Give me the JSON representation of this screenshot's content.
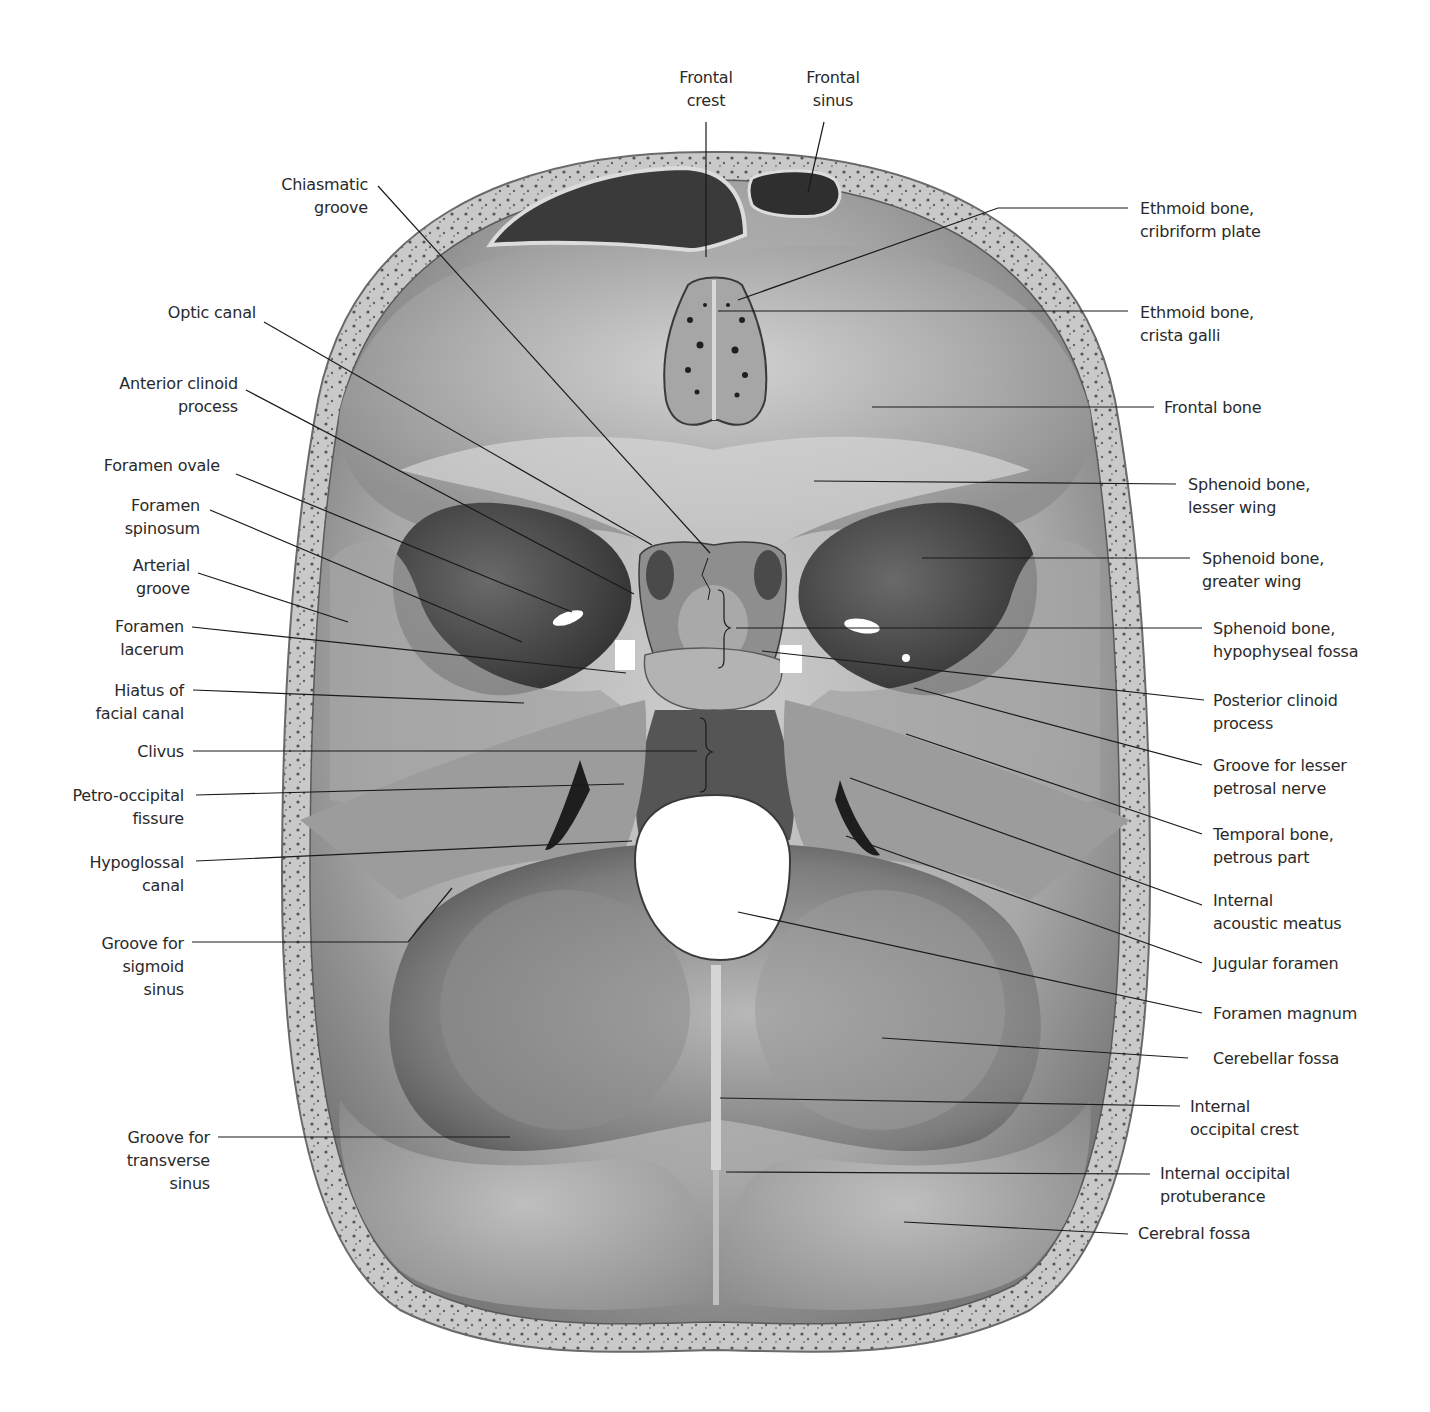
{
  "figure": {
    "colors": {
      "bone_light": "#d9d9d9",
      "bone_mid": "#9a9a9a",
      "bone_dark": "#4a4a4a",
      "cavity": "#2e2e2e",
      "foramen": "#ffffff",
      "leader": "#1a1a1a",
      "text": "#2a2a2a"
    }
  },
  "labels": {
    "top": [
      {
        "id": "frontal-crest",
        "text": "Frontal\ncrest"
      },
      {
        "id": "frontal-sinus",
        "text": "Frontal\nsinus"
      }
    ],
    "left": [
      {
        "id": "chiasmatic-groove",
        "text": "Chiasmatic\ngroove"
      },
      {
        "id": "optic-canal",
        "text": "Optic canal"
      },
      {
        "id": "anterior-clinoid-process",
        "text": "Anterior clinoid\nprocess"
      },
      {
        "id": "foramen-ovale",
        "text": "Foramen ovale"
      },
      {
        "id": "foramen-spinosum",
        "text": "Foramen\nspinosum"
      },
      {
        "id": "arterial-groove",
        "text": "Arterial\ngroove"
      },
      {
        "id": "foramen-lacerum",
        "text": "Foramen\nlacerum"
      },
      {
        "id": "hiatus-of-facial-canal",
        "text": "Hiatus of\nfacial canal"
      },
      {
        "id": "clivus",
        "text": "Clivus"
      },
      {
        "id": "petro-occipital-fissure",
        "text": "Petro-occipital\nfissure"
      },
      {
        "id": "hypoglossal-canal",
        "text": "Hypoglossal\ncanal"
      },
      {
        "id": "groove-for-sigmoid-sinus",
        "text": "Groove for\nsigmoid\nsinus"
      },
      {
        "id": "groove-for-transverse-sinus",
        "text": "Groove for\ntransverse\nsinus"
      }
    ],
    "right": [
      {
        "id": "ethmoid-cribriform-plate",
        "text": "Ethmoid bone,\ncribriform plate"
      },
      {
        "id": "ethmoid-crista-galli",
        "text": "Ethmoid bone,\ncrista galli"
      },
      {
        "id": "frontal-bone",
        "text": "Frontal bone"
      },
      {
        "id": "sphenoid-lesser-wing",
        "text": "Sphenoid bone,\nlesser wing"
      },
      {
        "id": "sphenoid-greater-wing",
        "text": "Sphenoid bone,\ngreater wing"
      },
      {
        "id": "sphenoid-hypophyseal-fossa",
        "text": "Sphenoid bone,\nhypophyseal fossa"
      },
      {
        "id": "posterior-clinoid-process",
        "text": "Posterior clinoid\nprocess"
      },
      {
        "id": "groove-lesser-petrosal-nerve",
        "text": "Groove for lesser\npetrosal nerve"
      },
      {
        "id": "temporal-petrous-part",
        "text": "Temporal bone,\npetrous part"
      },
      {
        "id": "internal-acoustic-meatus",
        "text": "Internal\nacoustic meatus"
      },
      {
        "id": "jugular-foramen",
        "text": "Jugular foramen"
      },
      {
        "id": "foramen-magnum",
        "text": "Foramen magnum"
      },
      {
        "id": "cerebellar-fossa",
        "text": "Cerebellar fossa"
      },
      {
        "id": "internal-occipital-crest",
        "text": "Internal\noccipital crest"
      },
      {
        "id": "internal-occipital-protuberance",
        "text": "Internal occipital\nprotuberance"
      },
      {
        "id": "cerebral-fossa",
        "text": "Cerebral fossa"
      }
    ]
  }
}
